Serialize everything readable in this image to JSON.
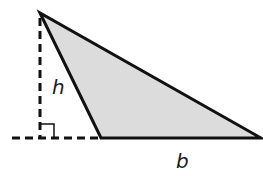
{
  "diagram": {
    "type": "obtuse-triangle-area",
    "labels": {
      "height": "h",
      "base": "b"
    },
    "colors": {
      "fill": "#dcdcdc",
      "stroke": "#111111"
    },
    "elements": [
      "shaded obtuse triangle",
      "dashed altitude drawn outside triangle",
      "dashed extension of base",
      "right-angle marker"
    ]
  }
}
